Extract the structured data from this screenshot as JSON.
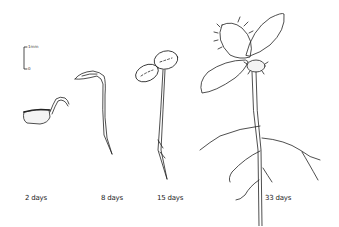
{
  "figure": {
    "scale_bar": {
      "top_label": "1mm",
      "bottom_label": "0"
    },
    "stages": [
      {
        "label": "2 days"
      },
      {
        "label": "8 days"
      },
      {
        "label": "15 days"
      },
      {
        "label": "33 days"
      }
    ]
  }
}
